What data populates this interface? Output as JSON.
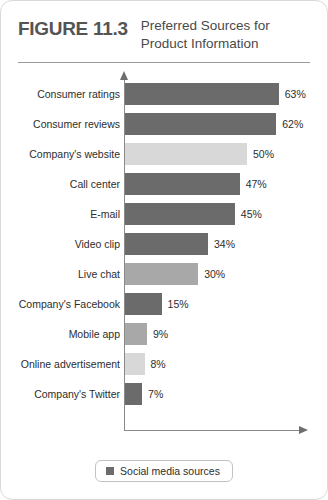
{
  "figure": {
    "label": "FIGURE 11.3",
    "title_line1": "Preferred Sources for",
    "title_line2": "Product Information"
  },
  "legend": {
    "label": "Social media sources",
    "swatch_color": "#6b6b6b"
  },
  "colors": {
    "dark": "#6b6b6b",
    "medium": "#a8a8a8",
    "light": "#d8d8d8",
    "axis": "#8a8a8a",
    "rule": "#9a9a9a",
    "card_border": "#d9d9d9",
    "figure_label": "#545454",
    "title": "#4a4a4a",
    "text": "#2d2d2d"
  },
  "chart_data": {
    "type": "bar",
    "orientation": "horizontal",
    "title": "Preferred Sources for Product Information",
    "xlabel": "",
    "ylabel": "",
    "xlim": [
      0,
      72
    ],
    "grid": false,
    "legend_position": "bottom-center",
    "legend_entries": [
      "Social media sources"
    ],
    "px_per_percent": 2.44,
    "categories": [
      "Consumer ratings",
      "Consumer reviews",
      "Company's website",
      "Call center",
      "E-mail",
      "Video clip",
      "Live chat",
      "Company's Facebook",
      "Mobile app",
      "Online advertisement",
      "Company's Twitter"
    ],
    "values": [
      63,
      62,
      50,
      47,
      45,
      34,
      30,
      15,
      9,
      8,
      7
    ],
    "value_labels": [
      "63%",
      "62%",
      "50%",
      "47%",
      "45%",
      "34%",
      "30%",
      "15%",
      "9%",
      "8%",
      "7%"
    ],
    "bar_colors": [
      "#6b6b6b",
      "#6b6b6b",
      "#d8d8d8",
      "#6b6b6b",
      "#6b6b6b",
      "#6b6b6b",
      "#a8a8a8",
      "#6b6b6b",
      "#a8a8a8",
      "#d8d8d8",
      "#6b6b6b"
    ],
    "bars": [
      {
        "category": "Consumer ratings",
        "value": 63,
        "label": "63%",
        "color": "#6b6b6b"
      },
      {
        "category": "Consumer reviews",
        "value": 62,
        "label": "62%",
        "color": "#6b6b6b"
      },
      {
        "category": "Company's website",
        "value": 50,
        "label": "50%",
        "color": "#d8d8d8"
      },
      {
        "category": "Call center",
        "value": 47,
        "label": "47%",
        "color": "#6b6b6b"
      },
      {
        "category": "E-mail",
        "value": 45,
        "label": "45%",
        "color": "#6b6b6b"
      },
      {
        "category": "Video clip",
        "value": 34,
        "label": "34%",
        "color": "#6b6b6b"
      },
      {
        "category": "Live chat",
        "value": 30,
        "label": "30%",
        "color": "#a8a8a8"
      },
      {
        "category": "Company's Facebook",
        "value": 15,
        "label": "15%",
        "color": "#6b6b6b"
      },
      {
        "category": "Mobile app",
        "value": 9,
        "label": "9%",
        "color": "#a8a8a8"
      },
      {
        "category": "Online advertisement",
        "value": 8,
        "label": "8%",
        "color": "#d8d8d8"
      },
      {
        "category": "Company's Twitter",
        "value": 7,
        "label": "7%",
        "color": "#6b6b6b"
      }
    ]
  }
}
